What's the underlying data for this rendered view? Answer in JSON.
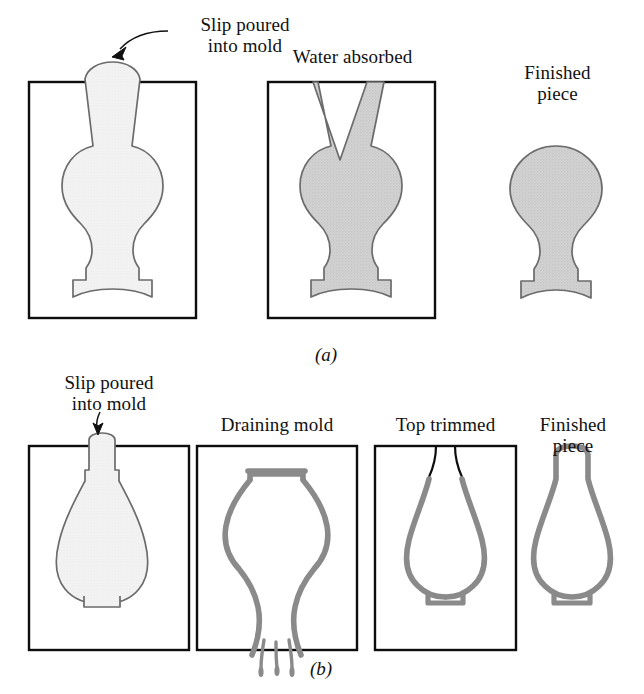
{
  "figure": {
    "background": "#ffffff"
  },
  "colors": {
    "mold_outline": "#0d0d0d",
    "slip_fill_light": "#f1f1f1",
    "slip_outline_light": "#6b6b6b",
    "slip_fill_dark": "#cacaca",
    "slip_outline_dark": "#6b6b6b",
    "wall_gray": "#8a8a8a",
    "text": "#111111"
  },
  "rows": [
    {
      "id": "row-a",
      "letter": "(a)",
      "process": "solid slip casting",
      "panels": [
        {
          "id": "a1",
          "label": "Slip poured\ninto mold",
          "has_mold_box": true,
          "has_callout_arrow": true,
          "shape": "solid-form-filled-light"
        },
        {
          "id": "a2",
          "label": "Water absorbed",
          "has_mold_box": true,
          "has_callout_arrow": false,
          "shape": "solid-form-filled-dark-with-v-notch"
        },
        {
          "id": "a3",
          "label": "Finished\npiece",
          "has_mold_box": false,
          "has_callout_arrow": false,
          "shape": "finished-solid-form"
        }
      ]
    },
    {
      "id": "row-b",
      "letter": "(b)",
      "process": "drain slip casting",
      "panels": [
        {
          "id": "b1",
          "label": "Slip poured\ninto mold",
          "has_mold_box": true,
          "has_callout_arrow": true,
          "shape": "vase-filled-light"
        },
        {
          "id": "b2",
          "label": "Draining mold",
          "has_mold_box": true,
          "has_callout_arrow": false,
          "shape": "vase-inverted-draining"
        },
        {
          "id": "b3",
          "label": "Top trimmed",
          "has_mold_box": true,
          "has_callout_arrow": false,
          "shape": "vase-hollow-open-top"
        },
        {
          "id": "b4",
          "label": "Finished\npiece",
          "has_mold_box": false,
          "has_callout_arrow": false,
          "shape": "vase-hollow-finished"
        }
      ]
    }
  ],
  "labels": {
    "a1": "Slip poured\ninto mold",
    "a2": "Water absorbed",
    "a3": "Finished\npiece",
    "b1": "Slip poured\ninto mold",
    "b2": "Draining mold",
    "b3": "Top trimmed",
    "b4": "Finished\npiece",
    "letter_a": "(a)",
    "letter_b": "(b)"
  }
}
